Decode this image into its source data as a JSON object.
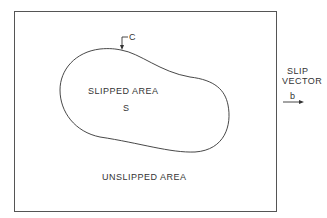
{
  "diagram": {
    "labels": {
      "curve": "C",
      "slipped_area": "SLIPPED AREA",
      "slipped_symbol": "S",
      "unslipped_area": "UNSLIPPED AREA",
      "slip_vector_line1": "SLIP",
      "slip_vector_line2": "VECTOR",
      "burgers_vector": "b"
    },
    "colors": {
      "line": "#333333",
      "background": "#ffffff"
    }
  }
}
